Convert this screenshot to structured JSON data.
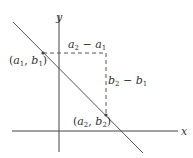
{
  "diagram": {
    "axes": {
      "x_label": "x",
      "y_label": "y"
    },
    "points": [
      {
        "name": "a",
        "sub": "1",
        "name2": "b",
        "sub2": "1",
        "label": "(a1, b1)"
      },
      {
        "name": "a",
        "sub": "2",
        "name2": "b",
        "sub2": "2",
        "label": "(a2, b2)"
      }
    ],
    "run_label": {
      "left": "a",
      "left_sub": "2",
      "op": " − ",
      "right": "a",
      "right_sub": "1",
      "text": "a2 − a1"
    },
    "rise_label": {
      "left": "b",
      "left_sub": "2",
      "op": " − ",
      "right": "b",
      "right_sub": "1",
      "text": "b2 − b1"
    },
    "colors": {
      "line": "#555555",
      "axis": "#444444",
      "dash": "#555555",
      "text": "#333333"
    }
  }
}
